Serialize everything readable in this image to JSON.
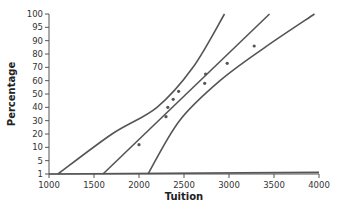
{
  "chart_data": {
    "type": "scatter",
    "title": "",
    "xlabel": "Tuition",
    "ylabel": "Percentage",
    "xlim": [
      1000,
      4000
    ],
    "x_ticks": [
      1000,
      1500,
      2000,
      2500,
      3000,
      3500,
      4000
    ],
    "y_ticks": [
      1,
      5,
      10,
      20,
      30,
      40,
      50,
      60,
      70,
      80,
      90,
      95,
      100
    ],
    "y_scale": "normal-probability",
    "grid": false,
    "legend": null,
    "series": [
      {
        "name": "observations",
        "kind": "points",
        "points": [
          {
            "x": 2000,
            "y": 12
          },
          {
            "x": 2300,
            "y": 33
          },
          {
            "x": 2320,
            "y": 40
          },
          {
            "x": 2380,
            "y": 46
          },
          {
            "x": 2440,
            "y": 52
          },
          {
            "x": 2730,
            "y": 58
          },
          {
            "x": 2740,
            "y": 65
          },
          {
            "x": 2980,
            "y": 73
          },
          {
            "x": 3280,
            "y": 86
          }
        ]
      },
      {
        "name": "fitted line",
        "kind": "line",
        "points": [
          {
            "x": 1600,
            "y": 1
          },
          {
            "x": 3450,
            "y": 100
          }
        ]
      },
      {
        "name": "upper confidence band",
        "kind": "curve",
        "points": [
          {
            "x": 1100,
            "y": 1
          },
          {
            "x": 1700,
            "y": 20
          },
          {
            "x": 2200,
            "y": 40
          },
          {
            "x": 2600,
            "y": 70
          },
          {
            "x": 2950,
            "y": 100
          }
        ]
      },
      {
        "name": "lower confidence band",
        "kind": "curve",
        "points": [
          {
            "x": 2100,
            "y": 1
          },
          {
            "x": 2450,
            "y": 30
          },
          {
            "x": 2900,
            "y": 60
          },
          {
            "x": 3400,
            "y": 85
          },
          {
            "x": 3950,
            "y": 100
          }
        ]
      },
      {
        "name": "baseline reference line",
        "kind": "line",
        "points": [
          {
            "x": 1000,
            "y": 1
          },
          {
            "x": 4000,
            "y": 1.5
          }
        ]
      }
    ]
  }
}
